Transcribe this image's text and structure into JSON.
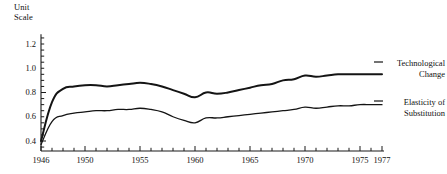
{
  "chart_data": {
    "type": "line",
    "title": "",
    "ylabel": "Unit\nScale",
    "xlabel": "",
    "xlim": [
      1946,
      1977
    ],
    "ylim": [
      0.3,
      1.3
    ],
    "grid": false,
    "legend_position": "right-inline",
    "y_ticks": [
      "1.2",
      "1.0",
      "0.8",
      "0.6",
      "0.4"
    ],
    "y_tick_values": [
      1.2,
      1.0,
      0.8,
      0.6,
      0.4
    ],
    "x_ticks": [
      "1946",
      "1950",
      "1955",
      "1960",
      "1965",
      "1970",
      "1975",
      "1977"
    ],
    "x_tick_values": [
      1946,
      1950,
      1955,
      1960,
      1965,
      1970,
      1975,
      1977
    ],
    "x": [
      1946,
      1947,
      1948,
      1949,
      1950,
      1951,
      1952,
      1953,
      1954,
      1955,
      1956,
      1957,
      1958,
      1959,
      1960,
      1961,
      1962,
      1963,
      1964,
      1965,
      1966,
      1967,
      1968,
      1969,
      1970,
      1971,
      1972,
      1973,
      1974,
      1975,
      1976,
      1977
    ],
    "series": [
      {
        "name": "Technological Change",
        "label": "Technological\nChange",
        "color": "#141414",
        "width": 2.0,
        "values": [
          0.4,
          0.72,
          0.83,
          0.85,
          0.86,
          0.86,
          0.85,
          0.86,
          0.87,
          0.88,
          0.87,
          0.85,
          0.82,
          0.79,
          0.76,
          0.8,
          0.79,
          0.8,
          0.82,
          0.84,
          0.86,
          0.87,
          0.9,
          0.91,
          0.94,
          0.93,
          0.94,
          0.95,
          0.95,
          0.95,
          0.95,
          0.95
        ]
      },
      {
        "name": "Elasticity of Substitution",
        "label": "Elasticity of\nSubstitution",
        "color": "#141414",
        "width": 1.3,
        "values": [
          0.37,
          0.56,
          0.61,
          0.63,
          0.64,
          0.65,
          0.65,
          0.66,
          0.66,
          0.67,
          0.66,
          0.64,
          0.6,
          0.57,
          0.55,
          0.59,
          0.59,
          0.6,
          0.61,
          0.62,
          0.63,
          0.64,
          0.65,
          0.66,
          0.68,
          0.67,
          0.68,
          0.69,
          0.69,
          0.7,
          0.7,
          0.7
        ]
      }
    ]
  },
  "geometry": {
    "plot_left": 41,
    "plot_right": 382,
    "y_for_1_2": 44,
    "y_for_0_4": 141,
    "axis_bottom": 151
  }
}
